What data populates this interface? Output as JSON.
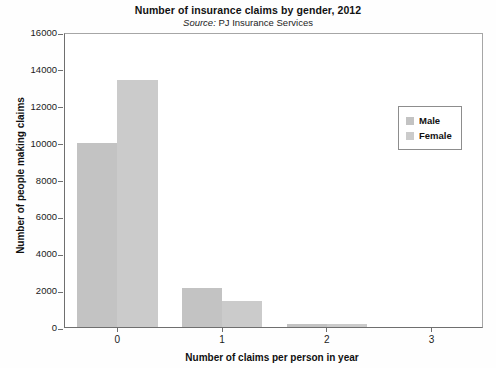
{
  "chart_data": {
    "type": "bar",
    "title": "Number of insurance claims by gender, 2012",
    "subtitle_prefix": "Source:",
    "subtitle_rest": " PJ Insurance Services",
    "subtitle": "Source: PJ Insurance Services",
    "xlabel": "Number of claims per person in year",
    "ylabel": "Number of people making claims",
    "categories": [
      "0",
      "1",
      "2",
      "3"
    ],
    "ylim": [
      0,
      16000
    ],
    "yticks": [
      0,
      2000,
      4000,
      6000,
      8000,
      10000,
      12000,
      14000,
      16000
    ],
    "ytick_labels": [
      "0",
      "2000",
      "4000",
      "6000",
      "8000",
      "10000",
      "12000",
      "14000",
      "16000"
    ],
    "grid": false,
    "legend_position": "upper right",
    "series": [
      {
        "name": "Male",
        "color": "#c3c3c3",
        "values": [
          10000,
          2100,
          150,
          0
        ]
      },
      {
        "name": "Female",
        "color": "#cbcbcb",
        "values": [
          13400,
          1400,
          150,
          0
        ]
      }
    ]
  },
  "legend": {
    "items": [
      {
        "label": "Male",
        "color": "#c3c3c3"
      },
      {
        "label": "Female",
        "color": "#cbcbcb"
      }
    ]
  }
}
